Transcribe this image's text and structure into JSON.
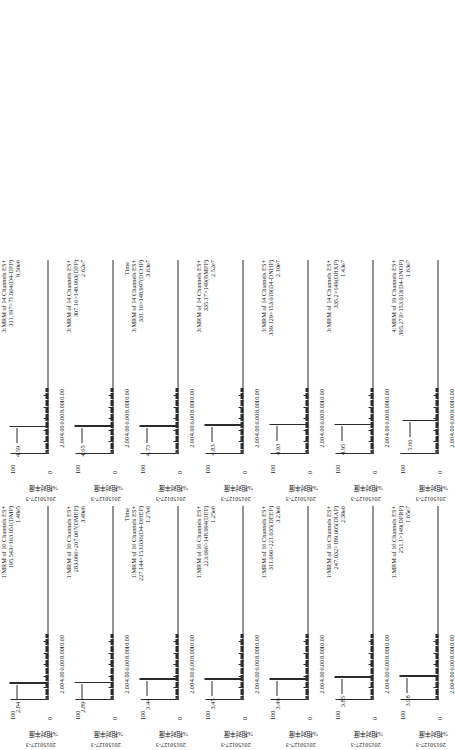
{
  "figure": {
    "sample_id": "20150127-3",
    "y_axis_title": "%相对丰度",
    "y_max_label": "100",
    "y_min_label": "0",
    "time_axis_label": "Time",
    "x_ticks": [
      "2.00",
      "4.00",
      "6.00",
      "8.00",
      "10.00"
    ],
    "x_range": [
      0,
      11.2
    ]
  },
  "chart_data": {
    "type": "line",
    "xlabel": "Time (min)",
    "ylabel": "%相对丰度",
    "xlim": [
      0,
      11.2
    ],
    "ylim": [
      0,
      100
    ],
    "grid": false,
    "legend": "none",
    "panels": [
      {
        "column": 1,
        "row": 1,
        "function": "1",
        "channels": "MRM of 16 Channels ES+",
        "transition": "195.543>163.051(DMP)",
        "intensity": "1.48e5",
        "sample": "20150127-3",
        "peaks": [
          {
            "rt": "2.84",
            "x": 2.84,
            "height": 100
          }
        ]
      },
      {
        "column": 1,
        "row": 2,
        "function": "1",
        "channels": "MRM of 16 Channels ES+",
        "transition": "283.096>207.067(DMEP)",
        "intensity": "3.49e6",
        "sample": "20150127-3",
        "peaks": [
          {
            "rt": "2.89",
            "x": 2.89,
            "height": 100
          }
        ]
      },
      {
        "column": 1,
        "row": 3,
        "function": "1",
        "channels": "MRM of 16 Channels ES+",
        "transition": "227.144>153.036(D4-DHEP)",
        "intensity": "1.27e6",
        "sample": "20150127-3",
        "peaks": [
          {
            "rt": "3.44",
            "x": 3.44,
            "height": 100
          }
        ]
      },
      {
        "column": 1,
        "row": 4,
        "function": "1",
        "channels": "MRM of 16 Channels ES+",
        "transition": "223.096>148.994(DEP)",
        "intensity": "1.25e6",
        "sample": "20150127-3",
        "peaks": [
          {
            "rt": "3.45",
            "x": 3.45,
            "height": 100
          }
        ]
      },
      {
        "column": 1,
        "row": 5,
        "function": "1",
        "channels": "MRM of 16 Channels ES+",
        "transition": "311.096>221.035(DEEP)",
        "intensity": "3.23e6",
        "sample": "20150127-3",
        "peaks": [
          {
            "rt": "3.46",
            "x": 3.46,
            "height": 100
          }
        ]
      },
      {
        "column": 1,
        "row": 6,
        "function": "1",
        "channels": "MRM of 16 Channels ES+",
        "transition": "247.032>189.005(DIAP)",
        "intensity": "2.38e6",
        "sample": "20150127-3",
        "peaks": [
          {
            "rt": "3.85",
            "x": 3.85,
            "height": 100
          }
        ]
      },
      {
        "column": 1,
        "row": 7,
        "function": "1",
        "channels": "MRM of 16 Channels ES+",
        "transition": "251.1>149(DPRP)",
        "intensity": "1.65e7",
        "sample": "20150127-3",
        "peaks": [
          {
            "rt": "3.98",
            "x": 3.98,
            "height": 100
          }
        ]
      },
      {
        "column": 2,
        "row": 1,
        "function": "3",
        "channels": "MRM of 14 Channels ES+",
        "transition": "311.197>71.064(D4-DPP)",
        "intensity": "9.50e6",
        "sample": "20150127-3",
        "peaks": [
          {
            "rt": "4.59",
            "x": 4.59,
            "height": 100
          }
        ]
      },
      {
        "column": 2,
        "row": 2,
        "function": "3",
        "channels": "MRM of 14 Channels ES+",
        "transition": "307.16>148.993(DPP)",
        "intensity": "2.62e7",
        "sample": "20150127-3",
        "peaks": [
          {
            "rt": "4.65",
            "x": 4.65,
            "height": 100
          }
        ]
      },
      {
        "column": 2,
        "row": 3,
        "function": "3",
        "channels": "MRM of 14 Channels ES+",
        "transition": "331.16>148.997(DCHP)",
        "intensity": "3.63e7",
        "sample": "20150127-3",
        "peaks": [
          {
            "rt": "4.73",
            "x": 4.73,
            "height": 100
          }
        ]
      },
      {
        "column": 2,
        "row": 4,
        "function": "3",
        "channels": "MRM of 14 Channels ES+",
        "transition": "335.17>149(BMPP)",
        "intensity": "2.52e7",
        "sample": "20150127-3",
        "peaks": [
          {
            "rt": "4.83",
            "x": 4.83,
            "height": 100
          }
        ]
      },
      {
        "column": 2,
        "row": 5,
        "function": "3",
        "channels": "MRM of 14 Channels ES+",
        "transition": "339.129>153.019(D4-DNHP)",
        "intensity": "2.10e7",
        "sample": "20150127-3",
        "peaks": [
          {
            "rt": "4.93",
            "x": 4.93,
            "height": 100
          }
        ]
      },
      {
        "column": 2,
        "row": 6,
        "function": "3",
        "channels": "MRM of 14 Channels ES+",
        "transition": "335.2>149(DHXP)",
        "intensity": "1.43e7",
        "sample": "20150127-3",
        "peaks": [
          {
            "rt": "4.95",
            "x": 4.95,
            "height": 100
          }
        ]
      },
      {
        "column": 2,
        "row": 7,
        "function": "4",
        "channels": "MRM of 19 Channels ES+",
        "transition": "395.273>153.013(D4-DNOP)",
        "intensity": "1.63e7",
        "sample": "20150127-3",
        "peaks": [
          {
            "rt": "5.66",
            "x": 5.66,
            "height": 92
          }
        ]
      }
    ],
    "extra_labels": [
      {
        "text": "Time",
        "column": 1
      },
      {
        "text": "Time",
        "column": 2
      }
    ]
  }
}
